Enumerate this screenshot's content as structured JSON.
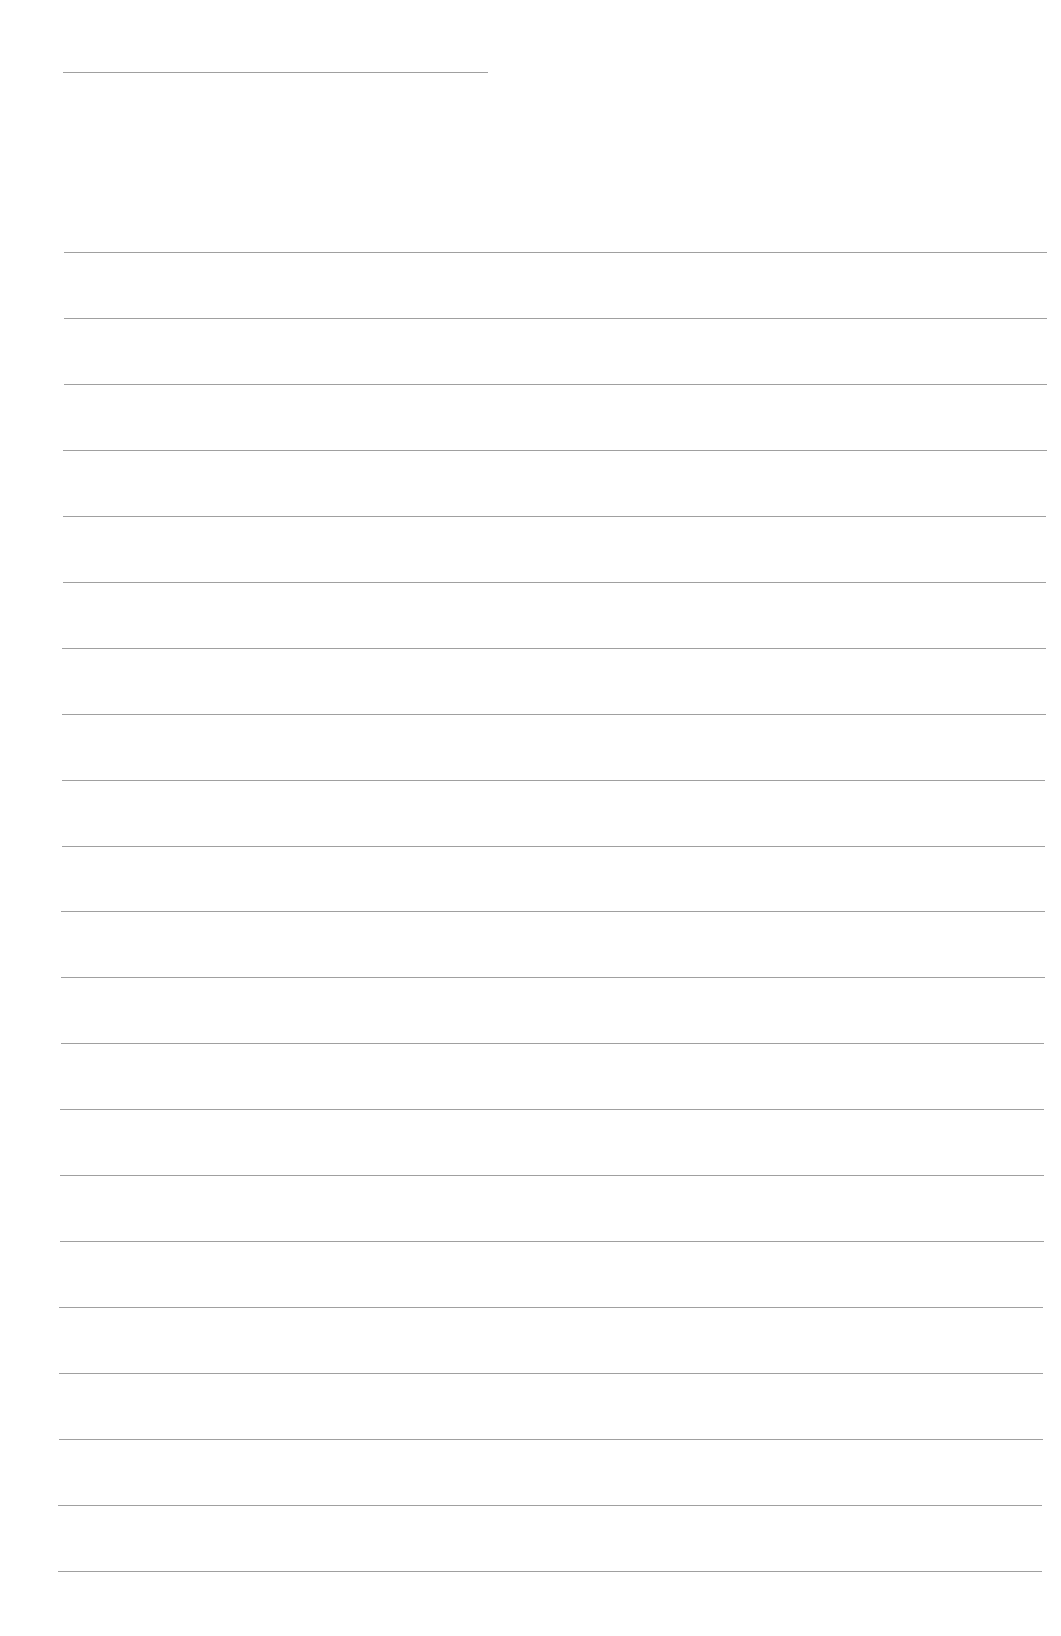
{
  "page": {
    "type": "ruled-notebook-page",
    "background_color": "#ffffff",
    "line_color": "#8f8f8f"
  },
  "header_rule": {
    "x1": 63,
    "x2": 488,
    "y": 72
  },
  "rules": [
    {
      "x1": 64,
      "x2": 1047,
      "y": 252
    },
    {
      "x1": 64,
      "x2": 1047,
      "y": 318
    },
    {
      "x1": 64,
      "x2": 1047,
      "y": 384
    },
    {
      "x1": 63,
      "x2": 1047,
      "y": 450
    },
    {
      "x1": 63,
      "x2": 1046,
      "y": 516
    },
    {
      "x1": 63,
      "x2": 1046,
      "y": 582
    },
    {
      "x1": 62,
      "x2": 1046,
      "y": 648
    },
    {
      "x1": 62,
      "x2": 1046,
      "y": 714
    },
    {
      "x1": 62,
      "x2": 1045,
      "y": 780
    },
    {
      "x1": 62,
      "x2": 1045,
      "y": 846
    },
    {
      "x1": 61,
      "x2": 1045,
      "y": 911
    },
    {
      "x1": 61,
      "x2": 1045,
      "y": 977
    },
    {
      "x1": 61,
      "x2": 1044,
      "y": 1043
    },
    {
      "x1": 60,
      "x2": 1044,
      "y": 1109
    },
    {
      "x1": 60,
      "x2": 1044,
      "y": 1175
    },
    {
      "x1": 60,
      "x2": 1044,
      "y": 1241
    },
    {
      "x1": 59,
      "x2": 1043,
      "y": 1307
    },
    {
      "x1": 59,
      "x2": 1043,
      "y": 1373
    },
    {
      "x1": 59,
      "x2": 1043,
      "y": 1439
    },
    {
      "x1": 58,
      "x2": 1042,
      "y": 1505
    },
    {
      "x1": 58,
      "x2": 1042,
      "y": 1571
    }
  ]
}
